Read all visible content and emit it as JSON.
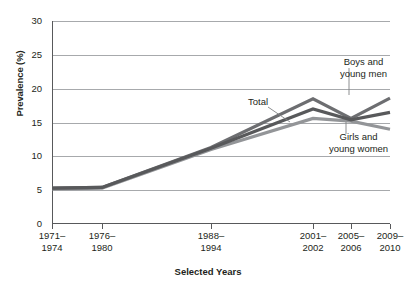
{
  "chart_data": {
    "type": "line",
    "title": "",
    "xlabel": "Selected Years",
    "ylabel": "Prevalence (%)",
    "ylim": [
      0,
      30
    ],
    "yticks": [
      0,
      5,
      10,
      15,
      20,
      25,
      30
    ],
    "grid": true,
    "legend_position": "inline-annotations",
    "categories": [
      "1971–1974",
      "1976–1980",
      "1988–1994",
      "2001–2002",
      "2005–2006",
      "2009–2010"
    ],
    "series": [
      {
        "name": "Boys and young men",
        "values": [
          5.3,
          5.4,
          11.3,
          18.5,
          15.6,
          18.6
        ],
        "color": "#6d6e71"
      },
      {
        "name": "Total",
        "values": [
          5.3,
          5.4,
          11.2,
          17.0,
          15.4,
          16.5
        ],
        "color": "#58595b"
      },
      {
        "name": "Girls and young women",
        "values": [
          5.2,
          5.3,
          11.0,
          15.6,
          15.2,
          14.0
        ],
        "color": "#939598"
      }
    ]
  },
  "axis": {
    "y_label": "Prevalence (%)",
    "y_ticks": [
      "30",
      "25",
      "20",
      "15",
      "10",
      "5",
      "0"
    ],
    "x_title": "Selected Years",
    "x_ticks": [
      "1971–\n1974",
      "1976–\n1980",
      "1988–\n1994",
      "2001–\n2002",
      "2005–\n2006",
      "2009–\n2010"
    ]
  },
  "annotations": {
    "total": "Total",
    "boys": "Boys and\nyoung men",
    "girls": "Girls and\nyoung women"
  },
  "colors": {
    "grid": "#a7a9ac",
    "axis": "#58595b",
    "text": "#231f20",
    "series_boys": "#6d6e71",
    "series_total": "#58595b",
    "series_girls": "#939598",
    "background": "#ffffff"
  }
}
